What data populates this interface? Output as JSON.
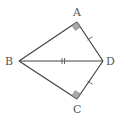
{
  "diagram": {
    "type": "geometry",
    "points": {
      "A": {
        "label": "A",
        "x": 77,
        "y": 22
      },
      "B": {
        "label": "B",
        "x": 19,
        "y": 61
      },
      "C": {
        "label": "C",
        "x": 77,
        "y": 99
      },
      "D": {
        "label": "D",
        "x": 103,
        "y": 61
      }
    },
    "segments": [
      "AB",
      "AD",
      "BD",
      "BC",
      "CD"
    ],
    "right_angles": [
      "A",
      "C"
    ],
    "equal_marks": {
      "single": [
        "AD",
        "CD"
      ],
      "double": [
        "BD"
      ]
    },
    "colors": {
      "line": "#444444",
      "right_angle_fill": "#aaaaaa",
      "label": "#555555"
    }
  }
}
